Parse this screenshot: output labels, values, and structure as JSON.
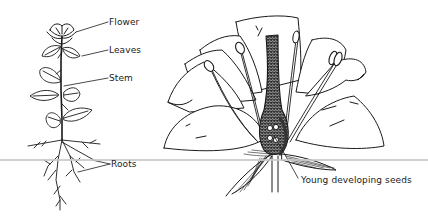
{
  "diagram": {
    "title": "",
    "plant": {
      "labels": [
        {
          "id": "flower",
          "text": "Flower"
        },
        {
          "id": "leaves",
          "text": "Leaves"
        },
        {
          "id": "stem",
          "text": "Stem"
        },
        {
          "id": "roots",
          "text": "Roots"
        }
      ]
    },
    "flower_section": {
      "labels": [
        {
          "id": "seeds",
          "text": "Young developing seeds"
        }
      ]
    },
    "colors": {
      "ink": "#1a1a1a",
      "background": "#ffffff",
      "scanline": "#c8c8c8"
    }
  }
}
